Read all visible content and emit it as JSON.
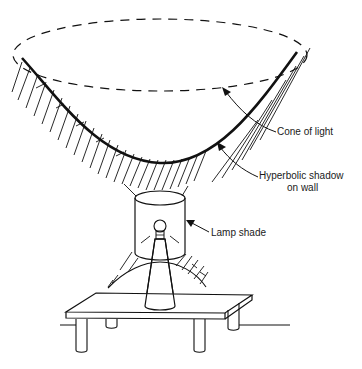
{
  "diagram": {
    "labels": {
      "cone_of_light": "Cone of light",
      "hyperbolic_shadow_line1": "Hyperbolic shadow",
      "hyperbolic_shadow_line2": "on wall",
      "lamp_shade": "Lamp shade"
    },
    "colors": {
      "ink": "#111111",
      "background": "#ffffff"
    }
  }
}
